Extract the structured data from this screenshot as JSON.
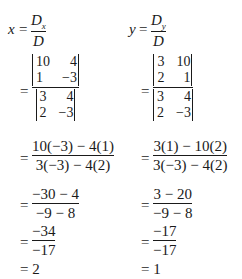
{
  "left": {
    "variable": "x",
    "ratio": {
      "numerator_symbol": "D",
      "numerator_subscript": "x",
      "denominator": "D"
    },
    "determinant_step": {
      "numerator_matrix": [
        [
          "10",
          "4"
        ],
        [
          "1",
          "−3"
        ]
      ],
      "denominator_matrix": [
        [
          "3",
          "4"
        ],
        [
          "2",
          "−3"
        ]
      ]
    },
    "expansion": {
      "numerator": "10(−3) − 4(1)",
      "denominator": "3(−3) − 4(2)"
    },
    "simplify": {
      "numerator": "−30 − 4",
      "denominator": "−9 − 8"
    },
    "reduced": {
      "numerator": "−34",
      "denominator": "−17"
    },
    "result": "= 2"
  },
  "right": {
    "variable": "y",
    "ratio": {
      "numerator_symbol": "D",
      "numerator_subscript": "y",
      "denominator": "D"
    },
    "determinant_step": {
      "numerator_matrix": [
        [
          "3",
          "10"
        ],
        [
          "2",
          "1"
        ]
      ],
      "denominator_matrix": [
        [
          "3",
          "4"
        ],
        [
          "2",
          "−3"
        ]
      ]
    },
    "expansion": {
      "numerator": "3(1) − 10(2)",
      "denominator": "3(−3) − 4(2)"
    },
    "simplify": {
      "numerator": "3 − 20",
      "denominator": "−9 − 8"
    },
    "reduced": {
      "numerator": "−17",
      "denominator": "−17"
    },
    "result": "= 1"
  },
  "symbols": {
    "equals": "="
  }
}
